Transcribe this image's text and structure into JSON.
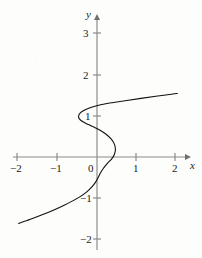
{
  "figure": {
    "title": "",
    "background_color": "#fdfdfc",
    "width": 202,
    "height": 258
  },
  "chart_data": {
    "type": "line",
    "title": "",
    "xlabel": "x",
    "ylabel": "y",
    "xlim": [
      -2.05,
      2.15
    ],
    "ylim": [
      -2.1,
      3.5
    ],
    "grid": false,
    "legend": null,
    "annotations": [],
    "axes": {
      "x_axis_label": "x",
      "y_axis_label": "y",
      "x_ticks": [
        -2,
        -1,
        0,
        1,
        2
      ],
      "x_tick_labels": [
        "−2",
        "−1",
        "0",
        "1",
        "2"
      ],
      "y_ticks": [
        -2,
        -1,
        1,
        2,
        3
      ],
      "y_tick_labels": [
        "−2",
        "−1",
        "1",
        "2",
        "3"
      ],
      "origin_label": "0",
      "x_arrow": true,
      "y_arrow": true,
      "axis_color": "#8c8c8c"
    },
    "series": [
      {
        "name": "curve",
        "description": "S-shaped cubic relation, x expressed as a function of y",
        "color": "#111111",
        "line_width": 1.1,
        "orientation": "x-as-function-of-y",
        "points": [
          [
            -2.0,
            -1.62
          ],
          [
            -1.7,
            -1.52
          ],
          [
            -1.4,
            -1.41
          ],
          [
            -1.1,
            -1.29
          ],
          [
            -0.85,
            -1.18
          ],
          [
            -0.62,
            -1.07
          ],
          [
            -0.42,
            -0.96
          ],
          [
            -0.26,
            -0.85
          ],
          [
            -0.13,
            -0.73
          ],
          [
            -0.04,
            -0.62
          ],
          [
            0.02,
            -0.52
          ],
          [
            0.08,
            -0.4
          ],
          [
            0.16,
            -0.28
          ],
          [
            0.26,
            -0.16
          ],
          [
            0.38,
            -0.04
          ],
          [
            0.45,
            0.08
          ],
          [
            0.47,
            0.2
          ],
          [
            0.44,
            0.32
          ],
          [
            0.36,
            0.44
          ],
          [
            0.24,
            0.55
          ],
          [
            0.1,
            0.64
          ],
          [
            -0.06,
            0.72
          ],
          [
            -0.22,
            0.79
          ],
          [
            -0.36,
            0.86
          ],
          [
            -0.45,
            0.93
          ],
          [
            -0.47,
            1.0
          ],
          [
            -0.42,
            1.08
          ],
          [
            -0.3,
            1.15
          ],
          [
            -0.12,
            1.22
          ],
          [
            0.12,
            1.28
          ],
          [
            0.42,
            1.33
          ],
          [
            0.76,
            1.38
          ],
          [
            1.12,
            1.43
          ],
          [
            1.5,
            1.48
          ],
          [
            1.9,
            1.53
          ],
          [
            2.05,
            1.55
          ]
        ]
      }
    ]
  }
}
